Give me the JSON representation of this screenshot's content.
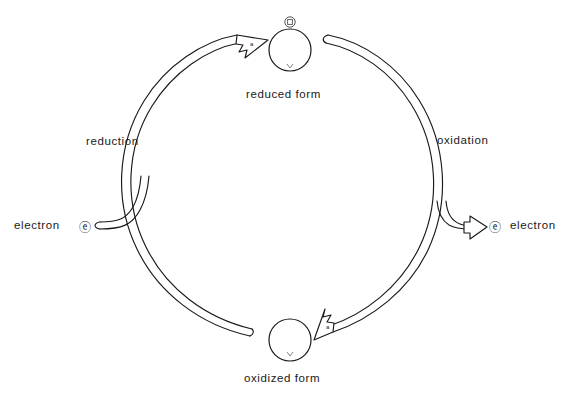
{
  "diagram": {
    "background_color": "#ffffff",
    "stroke_color": "#1a1a1a",
    "nodes": [
      {
        "id": "reduced-form",
        "label": "reduced  form",
        "shape": "circle",
        "cx": 290,
        "cy": 50,
        "r": 21,
        "badge": "electron-symbol",
        "badge_position": "top"
      },
      {
        "id": "oxidized-form",
        "label": "oxidized  form",
        "shape": "circle",
        "cx": 290,
        "cy": 340,
        "r": 21,
        "badge": null,
        "badge_position": null
      }
    ],
    "arcs": [
      {
        "id": "reduction-arc",
        "label": "reduction",
        "from": "oxidized-form",
        "to": "reduced-form",
        "direction": "counterclockwise",
        "side": "left",
        "arrowhead": "hollow",
        "arrowhead_at": "reduced-form"
      },
      {
        "id": "oxidation-arc",
        "label": "oxidation",
        "from": "reduced-form",
        "to": "oxidized-form",
        "direction": "clockwise",
        "side": "right",
        "arrowhead": "hollow",
        "arrowhead_at": "oxidized-form"
      }
    ],
    "branches": [
      {
        "id": "electron-in",
        "label": "electron",
        "symbol": "e-circled",
        "symbol_side": "right-of-label",
        "direction": "into-cycle",
        "side": "left",
        "arrowhead": "none"
      },
      {
        "id": "electron-out",
        "label": "electron",
        "symbol": "e-circled",
        "symbol_side": "left-of-label",
        "direction": "out-of-cycle",
        "side": "right",
        "arrowhead": "hollow"
      }
    ],
    "electron_symbol_glyph": "ⓔ",
    "arrow_glyph_label": "a"
  }
}
